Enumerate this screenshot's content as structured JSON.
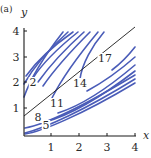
{
  "figure": {
    "panel_label": "(a)"
  },
  "colors": {
    "contour": "#4a5cb8",
    "axis": "#1a1a1a",
    "background": "#ffffff"
  },
  "chart_data": {
    "type": "contour",
    "title": "",
    "panel_label": "(a)",
    "xlabel": "x",
    "ylabel": "y",
    "xlim": [
      0,
      4
    ],
    "ylim": [
      0,
      4
    ],
    "x_ticks": [
      "1",
      "2",
      "3",
      "4"
    ],
    "y_ticks": [
      "1",
      "2",
      "3",
      "4"
    ],
    "grid": false,
    "contour_levels": [
      2,
      5,
      8,
      11,
      14,
      17
    ],
    "contour_labels": [
      {
        "text": "2",
        "x": 0.35,
        "y": 2.0
      },
      {
        "text": "5",
        "x": 0.85,
        "y": 0.35
      },
      {
        "text": "8",
        "x": 0.5,
        "y": 0.6
      },
      {
        "text": "11",
        "x": 1.15,
        "y": 1.1
      },
      {
        "text": "14",
        "x": 2.0,
        "y": 2.05
      },
      {
        "text": "17",
        "x": 2.95,
        "y": 3.05
      }
    ],
    "ridge_line": {
      "description": "straight black line along maximum",
      "from": [
        0,
        0.75
      ],
      "to": [
        4,
        4.2
      ]
    }
  },
  "axes": {
    "x_label": "x",
    "y_label": "y",
    "x_ticks": [
      {
        "label": "1",
        "px": 51
      },
      {
        "label": "2",
        "px": 79
      },
      {
        "label": "3",
        "px": 107
      },
      {
        "label": "4",
        "px": 135
      }
    ],
    "y_ticks": [
      {
        "label": "1",
        "py": 108
      },
      {
        "label": "2",
        "py": 82
      },
      {
        "label": "3",
        "py": 57
      },
      {
        "label": "4",
        "py": 31
      }
    ]
  },
  "contour_paths": {
    "upper": [
      "M24,97 C30,80 45,55 63,32",
      "M24,84 C32,70 48,50 68,32",
      "M26,76 C36,62 53,46 73,32",
      "M33,78 C42,64 58,48 78,32",
      "M38,82 C48,68 64,50 84,32",
      "M43,86 C54,70 70,52 90,32",
      "M52,98 C60,82 78,56 98,32",
      "M80,79 C82,64 92,46 104,32"
    ],
    "lower": [
      "M25,134 C40,132 80,116 135,83",
      "M25,133 C45,128 85,110 135,79",
      "M25,128 C48,124 90,102 135,75",
      "M45,122 C70,115 100,98 135,71",
      "M58,113 C80,106 108,88 135,65",
      "M87,91 C100,84 118,72 135,57",
      "M112,70 C120,64 128,56 135,47"
    ]
  },
  "contour_label_positions": [
    {
      "text": "2",
      "px": 33,
      "py": 86
    },
    {
      "text": "5",
      "px": 46,
      "py": 129
    },
    {
      "text": "8",
      "px": 38,
      "py": 121
    },
    {
      "text": "11",
      "px": 57,
      "py": 107
    },
    {
      "text": "14",
      "px": 80,
      "py": 87
    },
    {
      "text": "17",
      "px": 105,
      "py": 62
    }
  ]
}
